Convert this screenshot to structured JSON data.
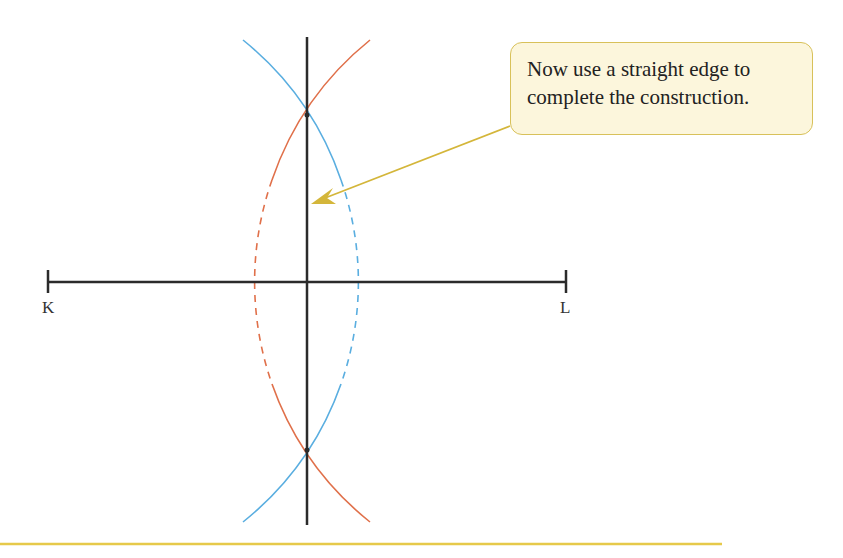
{
  "diagram": {
    "points": {
      "K": {
        "label": "K",
        "x": 48,
        "y": 282
      },
      "L": {
        "label": "L",
        "x": 566,
        "y": 282
      }
    },
    "segment_KL": {
      "x1": 48,
      "y1": 282,
      "x2": 566,
      "y2": 282
    },
    "bisector": {
      "x": 307,
      "y1": 37,
      "y2": 525
    },
    "intersections": [
      {
        "x": 307,
        "y": 115
      },
      {
        "x": 307,
        "y": 450
      }
    ],
    "arc_radius": 308,
    "colors": {
      "line": "#2b2b2b",
      "arc_from_K": "#e0704a",
      "arc_from_L": "#5aaee0",
      "arrow": "#d4b63a",
      "callout_bg": "#fcf6dc",
      "callout_border": "#d8c15a",
      "rule": "#e6c94a"
    }
  },
  "callout": {
    "line1": "Now use a straight edge to",
    "line2": "complete the construction."
  },
  "labels": {
    "K": "K",
    "L": "L"
  }
}
